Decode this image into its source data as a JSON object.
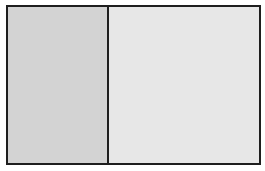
{
  "diagram": {
    "panels": [
      {
        "name": "left",
        "fill": "#d3d3d3"
      },
      {
        "name": "right",
        "fill": "#e7e7e7"
      }
    ],
    "border_color": "#1e1e1e"
  }
}
